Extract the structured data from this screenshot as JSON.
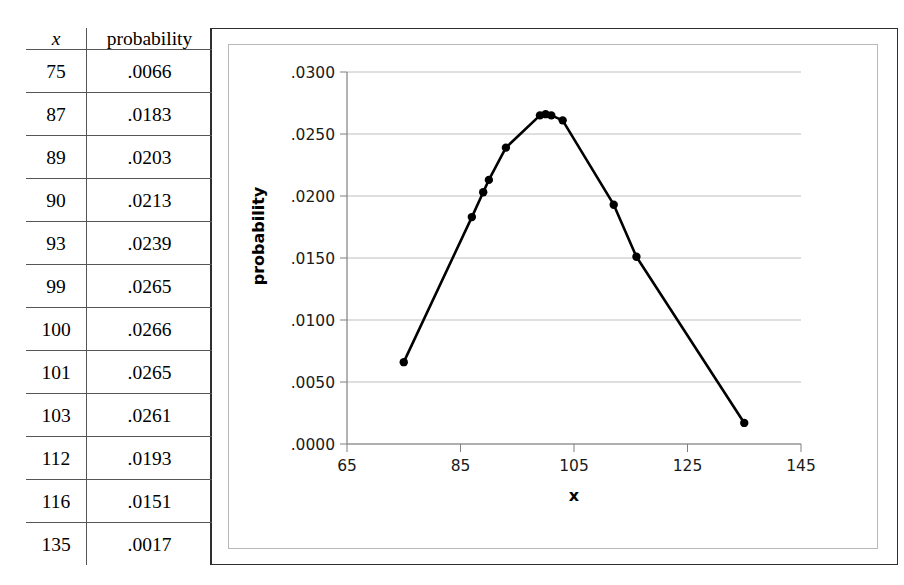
{
  "table": {
    "headers": [
      "x",
      "probability"
    ],
    "rows": [
      [
        "75",
        ".0066"
      ],
      [
        "87",
        ".0183"
      ],
      [
        "89",
        ".0203"
      ],
      [
        "90",
        ".0213"
      ],
      [
        "93",
        ".0239"
      ],
      [
        "99",
        ".0265"
      ],
      [
        "100",
        ".0266"
      ],
      [
        "101",
        ".0265"
      ],
      [
        "103",
        ".0261"
      ],
      [
        "112",
        ".0193"
      ],
      [
        "116",
        ".0151"
      ],
      [
        "135",
        ".0017"
      ]
    ]
  },
  "chart_data": {
    "type": "line",
    "title": "",
    "xlabel": "x",
    "ylabel": "probability",
    "x": [
      75,
      87,
      89,
      90,
      93,
      99,
      100,
      101,
      103,
      112,
      116,
      135
    ],
    "values": [
      0.0066,
      0.0183,
      0.0203,
      0.0213,
      0.0239,
      0.0265,
      0.0266,
      0.0265,
      0.0261,
      0.0193,
      0.0151,
      0.0017
    ],
    "xlim": [
      65,
      145
    ],
    "ylim": [
      0.0,
      0.03
    ],
    "xticks": [
      65,
      85,
      105,
      125,
      145
    ],
    "xtick_labels": [
      "65",
      "85",
      "105",
      "125",
      "145"
    ],
    "yticks": [
      0.0,
      0.005,
      0.01,
      0.015,
      0.02,
      0.025,
      0.03
    ],
    "ytick_labels": [
      ".0000",
      ".0050",
      ".0100",
      ".0150",
      ".0200",
      ".0250",
      ".0300"
    ],
    "grid": "horizontal",
    "legend": "none",
    "marker": "circle",
    "line_color": "#000000",
    "marker_color": "#000000",
    "grid_color": "#bfbfbf",
    "axis_color": "#808080"
  }
}
